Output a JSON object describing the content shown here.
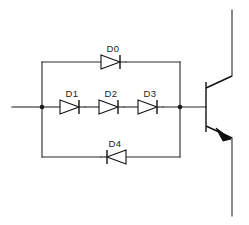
{
  "diagram": {
    "type": "electronic-schematic",
    "canvas": {
      "width": 249,
      "height": 225,
      "background": "#ffffff"
    },
    "colors": {
      "wire": "#2b2b2b",
      "device_outline": "#111111",
      "label_text": "#1c1c1c",
      "node_dot": "#1a1a1a",
      "background": "#ffffff"
    }
  },
  "components": {
    "diodes": [
      {
        "ref": "D0",
        "branch": "top",
        "orientation": "left-to-right",
        "label_x": 115,
        "label_y": 52,
        "center_x": 113,
        "center_y": 62
      },
      {
        "ref": "D1",
        "branch": "middle",
        "orientation": "left-to-right",
        "label_x": 72,
        "label_y": 97,
        "center_x": 72,
        "center_y": 107
      },
      {
        "ref": "D2",
        "branch": "middle",
        "orientation": "left-to-right",
        "label_x": 111,
        "label_y": 97,
        "center_x": 111,
        "center_y": 107
      },
      {
        "ref": "D3",
        "branch": "middle",
        "orientation": "left-to-right",
        "label_x": 150,
        "label_y": 97,
        "center_x": 150,
        "center_y": 107
      },
      {
        "ref": "D4",
        "branch": "bottom",
        "orientation": "right-to-left",
        "label_x": 115,
        "label_y": 147,
        "center_x": 113,
        "center_y": 157
      }
    ],
    "transistor": {
      "ref": "",
      "type": "NPN bipolar junction transistor",
      "base_bar_x": 206,
      "base_bar_top_y": 82,
      "base_bar_bottom_y": 132,
      "collector_x": 232,
      "collector_top_y": 10,
      "emitter_x": 232,
      "emitter_bottom_y": 216,
      "emitter_arrow": "filled-pointing-away-from-base"
    },
    "nodes": [
      {
        "name": "left-junction",
        "x": 42,
        "y": 107
      },
      {
        "name": "right-junction",
        "x": 180,
        "y": 107
      }
    ],
    "rails": {
      "left_rail_x": 42,
      "right_rail_x": 180,
      "top_rail_y": 62,
      "middle_rail_y": 107,
      "bottom_rail_y": 157,
      "input_wire_start_x": 12
    }
  }
}
